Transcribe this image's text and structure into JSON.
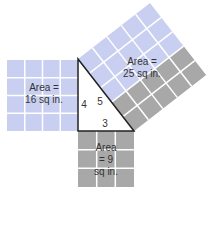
{
  "diagram": {
    "colors": {
      "blue_tile": "#c9cff0",
      "gray_tile": "#a8a8a8",
      "grid_line": "#ffffff",
      "triangle_stroke": "#222222",
      "triangle_fill": "#ffffff"
    },
    "squares": {
      "left": {
        "line1": "Area =",
        "line2": "16 sq in."
      },
      "hypotenuse": {
        "line1": "Area =",
        "line2": "25 sq in."
      },
      "bottom": {
        "line1": "Area",
        "line2": "= 9",
        "line3": "sq in."
      }
    },
    "triangle": {
      "side_vertical": "4",
      "side_hypotenuse": "5",
      "side_horizontal": "3"
    }
  }
}
